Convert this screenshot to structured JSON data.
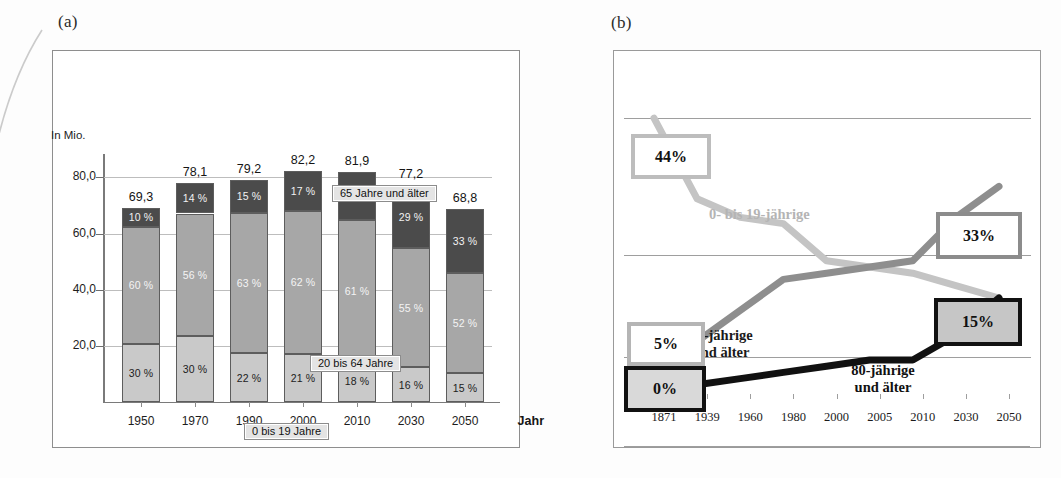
{
  "figure": {
    "panel_a_letter": "(a)",
    "panel_b_letter": "(b)"
  },
  "panel_a": {
    "y_axis_unit": "In Mio.",
    "x_axis_title": "Jahr",
    "y_ticks": [
      "20,0",
      "40,0",
      "60,0",
      "80,0"
    ],
    "callouts": [
      {
        "id": "65-plus",
        "label": "65 Jahre und älter"
      },
      {
        "id": "20-64",
        "label": "20 bis 64  Jahre"
      },
      {
        "id": "0-19",
        "label": "0 bis 19 Jahre"
      }
    ],
    "colors": {
      "old": "#4b4b4b",
      "middle": "#a7a7a7",
      "young": "#c9c9c9"
    },
    "chart_data": {
      "type": "bar",
      "title": "Bevölkerung Deutschlands nach Altersgruppen",
      "subtype": "stacked",
      "xlabel": "Jahr",
      "ylabel": "In Mio.",
      "ylim": [
        0,
        88
      ],
      "grid": true,
      "legend_position": "inline-callouts",
      "categories": [
        "1950",
        "1970",
        "1990",
        "2000",
        "2010",
        "2030",
        "2050"
      ],
      "totals": [
        "69,3",
        "78,1",
        "79,2",
        "82,2",
        "81,9",
        "77,2",
        "68,8"
      ],
      "totals_numeric": [
        69.3,
        78.1,
        79.2,
        82.2,
        81.9,
        77.2,
        68.8
      ],
      "series": [
        {
          "name": "0 bis 19 Jahre",
          "labels": [
            "30 %",
            "30 %",
            "22 %",
            "21 %",
            "18 %",
            "16 %",
            "15 %"
          ],
          "values": [
            30,
            30,
            22,
            21,
            18,
            16,
            15
          ]
        },
        {
          "name": "20 bis 64 Jahre",
          "labels": [
            "60 %",
            "56 %",
            "63 %",
            "62 %",
            "61 %",
            "55 %",
            "52 %"
          ],
          "values": [
            60,
            56,
            63,
            62,
            61,
            55,
            52
          ]
        },
        {
          "name": "65 Jahre und älter",
          "labels": [
            "10 %",
            "14 %",
            "15 %",
            "17 %",
            "21 %",
            "29 %",
            "33 %"
          ],
          "values": [
            10,
            14,
            15,
            17,
            21,
            29,
            33
          ]
        }
      ]
    }
  },
  "panel_b": {
    "series_names": {
      "young": "0- bis 19-jährige",
      "sixtyfive": "65-jährige\nund älter",
      "eighty": "80-jährige\nund älter"
    },
    "series_name_65_line1": "65-jährige",
    "series_name_65_line2": "und älter",
    "series_name_80_line1": "80-jährige",
    "series_name_80_line2": "und älter",
    "callouts": {
      "young_start": "44%",
      "young_end": "15%",
      "sixtyfive_start": "5%",
      "sixtyfive_end": "33%",
      "eighty_start": "0%"
    },
    "chart_data": {
      "type": "line",
      "title": "Altersstruktur der Bevölkerung im Zeitverlauf",
      "xlabel": "",
      "ylabel": "Anteil in %",
      "ylim": [
        0,
        50
      ],
      "grid": true,
      "legend_position": "inline-labels",
      "x": [
        "1871",
        "1939",
        "1960",
        "1980",
        "2000",
        "2005",
        "2010",
        "2030",
        "2050"
      ],
      "series": [
        {
          "name": "0- bis 19-jährige",
          "color": "#c4c4c4",
          "values": [
            44,
            31,
            28,
            27,
            21,
            20,
            19,
            17,
            15
          ],
          "start_label": "44%",
          "end_label": "15%"
        },
        {
          "name": "65-jährige und älter",
          "color": "#8e8e8e",
          "values": [
            5,
            8,
            13,
            18,
            19,
            20,
            21,
            28,
            33
          ],
          "start_label": "5%",
          "end_label": "33%"
        },
        {
          "name": "80-jährige und älter",
          "color": "#111111",
          "values": [
            0,
            1,
            2,
            3,
            4,
            5,
            5,
            9,
            15
          ],
          "start_label": "0%",
          "end_label": "15%"
        }
      ]
    }
  }
}
